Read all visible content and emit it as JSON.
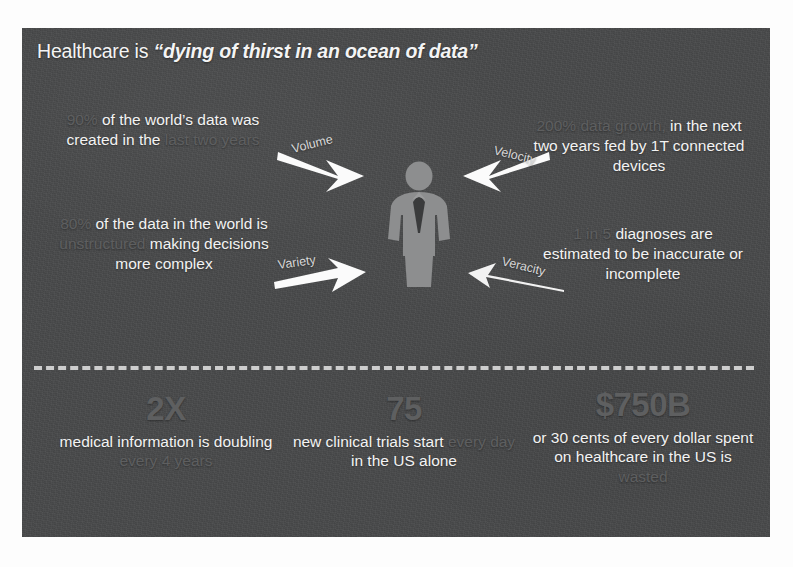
{
  "slide": {
    "title": {
      "lead": "Healthcare is ",
      "quote": "“dying of thirst in an ocean of data”"
    },
    "background_color": "#494a4b",
    "bright_text_color": "#f3f3f3",
    "dim_text_color": "#5e5f60"
  },
  "center_figure": {
    "icon": "person-with-necktie-icon",
    "fill_color": "#8d8e8f"
  },
  "arrows": [
    {
      "id": "volume",
      "label": "Volume",
      "icon": "arrow-down-right-thick-icon",
      "direction": "down-right",
      "style": "thick"
    },
    {
      "id": "velocity",
      "label": "Velocity",
      "icon": "arrow-down-left-thick-icon",
      "direction": "down-left",
      "style": "thick"
    },
    {
      "id": "variety",
      "label": "Variety",
      "icon": "arrow-right-thick-icon",
      "direction": "right",
      "style": "thick"
    },
    {
      "id": "veracity",
      "label": "Veracity",
      "icon": "arrow-left-thin-icon",
      "direction": "left",
      "style": "thin"
    }
  ],
  "upper_stats": [
    {
      "id": "volume",
      "v_word": "Volume",
      "segments": [
        {
          "text": "90%",
          "emphasis": "dim"
        },
        {
          "text": " of the world’s data was created in the ",
          "emphasis": "bright"
        },
        {
          "text": "last two years",
          "emphasis": "dim"
        }
      ]
    },
    {
      "id": "variety",
      "v_word": "Variety",
      "segments": [
        {
          "text": "80%",
          "emphasis": "dim"
        },
        {
          "text": " of the data in the world is ",
          "emphasis": "bright"
        },
        {
          "text": "unstructured",
          "emphasis": "dim"
        },
        {
          "text": " making decisions more complex",
          "emphasis": "bright"
        }
      ]
    },
    {
      "id": "velocity",
      "v_word": "Velocity",
      "segments": [
        {
          "text": "200% data growth,",
          "emphasis": "dim"
        },
        {
          "text": " in the next two years fed by 1T connected devices",
          "emphasis": "bright"
        }
      ]
    },
    {
      "id": "veracity",
      "v_word": "Veracity",
      "segments": [
        {
          "text": "1 in 5",
          "emphasis": "dim"
        },
        {
          "text": " diagnoses are estimated to be inaccurate or incomplete",
          "emphasis": "bright"
        }
      ]
    }
  ],
  "divider": {
    "style": "dashed",
    "color": "#d9d9d9"
  },
  "bottom_stats": [
    {
      "id": "doubling",
      "figure": "2X",
      "figure_emphasis": "dim",
      "segments": [
        {
          "text": "medical information is doubling ",
          "emphasis": "bright"
        },
        {
          "text": "every 4 years",
          "emphasis": "dim"
        }
      ]
    },
    {
      "id": "trials",
      "figure": "75",
      "figure_emphasis": "dim",
      "segments": [
        {
          "text": "new clinical trials start ",
          "emphasis": "bright"
        },
        {
          "text": "every day",
          "emphasis": "dim"
        },
        {
          "text": " in the US alone",
          "emphasis": "bright"
        }
      ]
    },
    {
      "id": "waste",
      "figure": "$750B",
      "figure_emphasis": "dim",
      "segments": [
        {
          "text": "or 30 cents of every dollar spent on healthcare in the US is ",
          "emphasis": "bright"
        },
        {
          "text": "wasted",
          "emphasis": "dim"
        }
      ]
    }
  ]
}
